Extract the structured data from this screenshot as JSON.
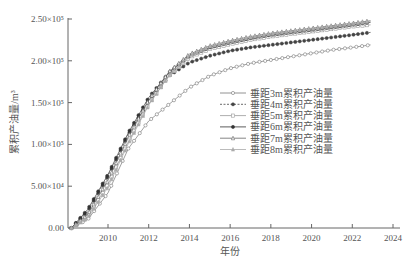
{
  "chart_data": {
    "type": "line",
    "title": "",
    "xlabel": "年份",
    "ylabel": "累积产油量/m³",
    "xlim": [
      2008,
      2024.3
    ],
    "ylim": [
      0,
      250000
    ],
    "xticks": [
      2010,
      2012,
      2014,
      2016,
      2018,
      2020,
      2022,
      2024
    ],
    "yticks": [
      0,
      50000,
      100000,
      150000,
      200000,
      250000
    ],
    "ytick_labels": [
      "0.00",
      "5.00×10⁴",
      "1.00×10⁵",
      "1.50×10⁵",
      "2.00×10⁵",
      "2.50×10⁵"
    ],
    "grid": false,
    "legend_position": "center-right",
    "x": [
      2008.2,
      2009,
      2010,
      2011,
      2012,
      2013,
      2014,
      2015,
      2016,
      2017,
      2018,
      2019,
      2020,
      2021,
      2022,
      2022.9
    ],
    "series": [
      {
        "name": "垂距3m累积产油量",
        "marker": "circle-open",
        "line": "solid",
        "values": [
          0,
          10000,
          42000,
          95000,
          128000,
          148000,
          168000,
          182000,
          191000,
          197000,
          201000,
          205000,
          209000,
          213000,
          216000,
          219000
        ]
      },
      {
        "name": "垂距4m累积产油量",
        "marker": "circle-filled",
        "line": "dashed",
        "values": [
          0,
          20000,
          62000,
          112000,
          152000,
          182000,
          198000,
          206000,
          212000,
          216000,
          219000,
          222000,
          225000,
          228000,
          231000,
          234000
        ]
      },
      {
        "name": "垂距5m累积产油量",
        "marker": "square-open",
        "line": "solid",
        "values": [
          0,
          14000,
          52000,
          103000,
          148000,
          182000,
          204000,
          214000,
          220000,
          225000,
          229000,
          232000,
          235000,
          238000,
          241000,
          243000
        ]
      },
      {
        "name": "垂距6m累积产油量",
        "marker": "circle-filled",
        "line": "solid",
        "values": [
          0,
          22000,
          64000,
          114000,
          156000,
          186000,
          206000,
          216000,
          222000,
          227000,
          231000,
          234000,
          237000,
          240000,
          243000,
          246000
        ]
      },
      {
        "name": "垂距7m累积产油量",
        "marker": "triangle-open",
        "line": "solid",
        "values": [
          0,
          16000,
          57000,
          109000,
          153000,
          187000,
          208000,
          218000,
          224000,
          229000,
          233000,
          236000,
          239000,
          242000,
          245000,
          248000
        ]
      },
      {
        "name": "垂距8m累积产油量",
        "marker": "triangle-filled",
        "line": "solid",
        "values": [
          0,
          12000,
          49000,
          101000,
          147000,
          183000,
          206000,
          217000,
          223000,
          228000,
          232000,
          235000,
          238000,
          241000,
          244000,
          247000
        ]
      }
    ]
  },
  "axes": {
    "xlabel": "年份",
    "ylabel": "累积产油量/m³"
  }
}
